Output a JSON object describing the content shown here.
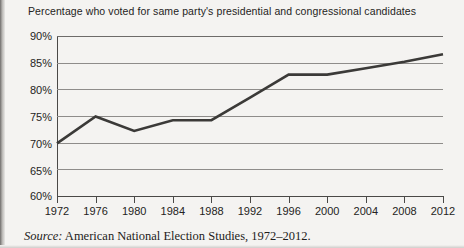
{
  "chart_data": {
    "type": "line",
    "title": "Percentage who voted for same party's presidential and congressional candidates",
    "xlabel": "",
    "ylabel": "",
    "x": [
      1972,
      1976,
      1980,
      1984,
      1988,
      1992,
      1996,
      2000,
      2004,
      2008,
      2012
    ],
    "categories": [
      "1972",
      "1976",
      "1980",
      "1984",
      "1988",
      "1992",
      "1996",
      "2000",
      "2004",
      "2008",
      "2012"
    ],
    "values": [
      70.0,
      75.0,
      72.3,
      74.3,
      74.3,
      78.5,
      82.8,
      82.8,
      84.0,
      85.2,
      86.6
    ],
    "series": [
      {
        "name": "Percentage voting same party",
        "values": [
          70.0,
          75.0,
          72.3,
          74.3,
          74.3,
          78.5,
          82.8,
          82.8,
          84.0,
          85.2,
          86.6
        ]
      }
    ],
    "ylim": [
      60,
      90
    ],
    "xlim": [
      1972,
      2012
    ],
    "ytick_labels": [
      "90%",
      "85%",
      "80%",
      "75%",
      "70%",
      "65%",
      "60%"
    ],
    "ytick_values": [
      90,
      85,
      80,
      75,
      70,
      65,
      60
    ],
    "xtick_labels": [
      "1972",
      "1976",
      "1980",
      "1984",
      "1988",
      "1992",
      "1996",
      "2000",
      "2004",
      "2008",
      "2012"
    ],
    "grid": true,
    "legend": null,
    "legend_position": "none",
    "line_color": "#3b3a38",
    "grid_color": "#8e8c8a",
    "background_color": "#f4f3f1"
  },
  "source": {
    "label": "Source:",
    "text": " American National Election Studies, 1972–2012."
  }
}
